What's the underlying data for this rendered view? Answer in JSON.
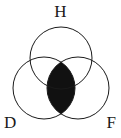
{
  "figure": {
    "type": "venn-diagram",
    "set_count": 3,
    "background_color": "#ffffff",
    "stroke_color": "#1a1a1a",
    "shade_color": "#111111",
    "shaded_region": "D-intersect-F",
    "shaded_region_description": "Vertical lens where the D circle and the F circle overlap, including the part inside H"
  },
  "labels": {
    "top": "H",
    "bottom_left": "D",
    "bottom_right": "F"
  },
  "circles": [
    {
      "id": "H",
      "label": "H",
      "cx": 61,
      "cy": 58,
      "r": 31
    },
    {
      "id": "D",
      "label": "D",
      "cx": 44,
      "cy": 88,
      "r": 31
    },
    {
      "id": "F",
      "label": "F",
      "cx": 78,
      "cy": 88,
      "r": 31
    }
  ]
}
